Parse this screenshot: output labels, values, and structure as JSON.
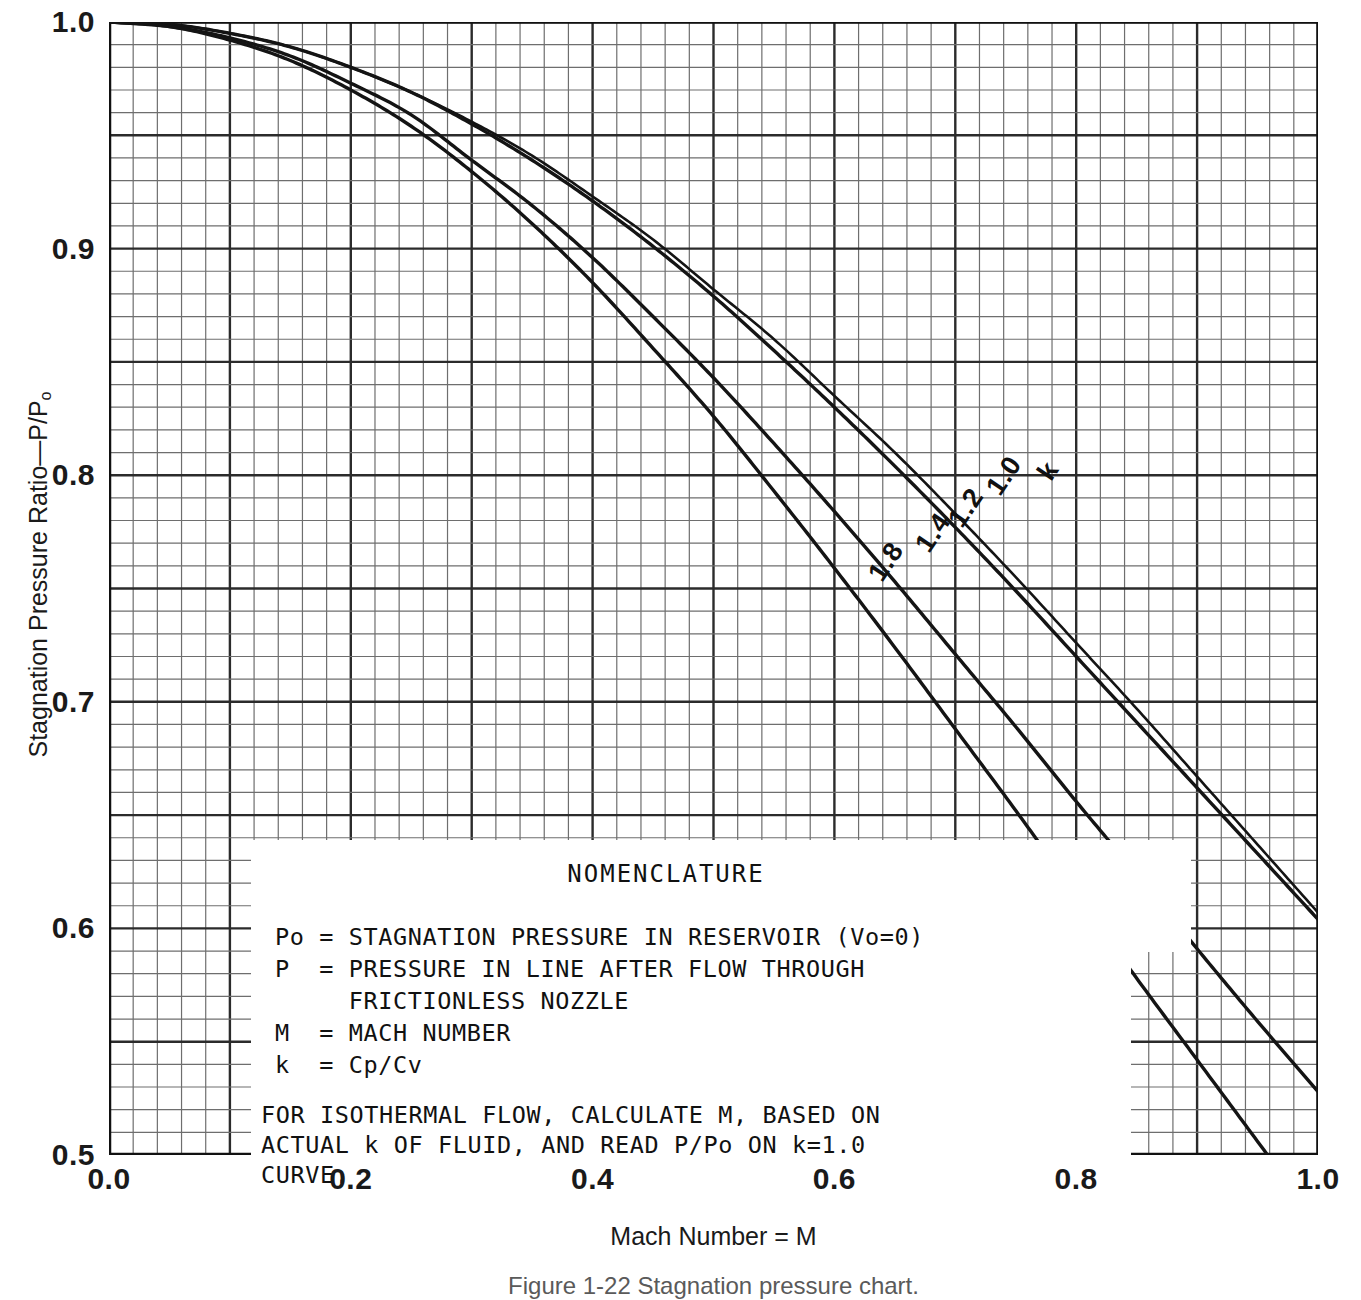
{
  "axes": {
    "x_title": "Mach Number = M",
    "y_title_main": "Stagnation Pressure Ratio—P/P",
    "y_title_sub": "o",
    "x_ticks": [
      "0.0",
      "0.2",
      "0.4",
      "0.6",
      "0.8",
      "1.0"
    ],
    "y_ticks": [
      "1.0",
      "0.9",
      "0.8",
      "0.7",
      "0.6",
      "0.5"
    ]
  },
  "caption": "Figure 1-22  Stagnation pressure chart.",
  "nomenclature": {
    "title": "NOMENCLATURE",
    "rows": [
      {
        "sym": "Po",
        "eq": "=",
        "text": "STAGNATION PRESSURE IN RESERVOIR (Vo=0)"
      },
      {
        "sym": "P",
        "eq": "=",
        "text": "PRESSURE IN LINE AFTER FLOW THROUGH"
      },
      {
        "sym": "",
        "eq": "",
        "text": "FRICTIONLESS NOZZLE"
      },
      {
        "sym": "M",
        "eq": "=",
        "text": "MACH NUMBER"
      },
      {
        "sym": "k",
        "eq": "=",
        "text": "Cp/Cv"
      }
    ],
    "note_line1": "FOR ISOTHERMAL FLOW, CALCULATE M, BASED ON",
    "note_line2": "ACTUAL k OF FLUID, AND READ P/Po ON k=1.0",
    "note_line3": "CURVE."
  },
  "curve_labels": [
    {
      "text": "k",
      "x": 935,
      "y": 440,
      "rot": -56
    },
    {
      "text": "1.0",
      "x": 884,
      "y": 455,
      "rot": -56
    },
    {
      "text": "1.2",
      "x": 846,
      "y": 487,
      "rot": -56
    },
    {
      "text": "1.4",
      "x": 813,
      "y": 512,
      "rot": -56
    },
    {
      "text": "1.8",
      "x": 766,
      "y": 541,
      "rot": -56
    }
  ],
  "chart_data": {
    "type": "line",
    "title": "Stagnation pressure chart",
    "xlabel": "Mach Number = M",
    "ylabel": "Stagnation Pressure Ratio—P/Po",
    "xlim": [
      0.0,
      1.0
    ],
    "ylim": [
      0.5,
      1.0
    ],
    "grid": true,
    "grid_major_x": 0.1,
    "grid_minor_x": 0.02,
    "grid_major_y": 0.05,
    "grid_minor_y": 0.01,
    "legend": "inline curve labels (k = 1.0, 1.2, 1.4, 1.8)",
    "x": [
      0.0,
      0.05,
      0.1,
      0.15,
      0.2,
      0.25,
      0.3,
      0.35,
      0.4,
      0.45,
      0.5,
      0.55,
      0.6,
      0.65,
      0.7,
      0.75,
      0.8,
      0.85,
      0.9,
      0.95,
      1.0
    ],
    "series": [
      {
        "name": "k = 1.0",
        "values": [
          1.0,
          0.999,
          0.995,
          0.989,
          0.98,
          0.969,
          0.956,
          0.941,
          0.923,
          0.904,
          0.882,
          0.86,
          0.835,
          0.81,
          0.783,
          0.755,
          0.726,
          0.697,
          0.667,
          0.637,
          0.607
        ]
      },
      {
        "name": "k = 1.2",
        "values": [
          1.0,
          0.999,
          0.995,
          0.989,
          0.98,
          0.969,
          0.955,
          0.939,
          0.921,
          0.901,
          0.879,
          0.855,
          0.83,
          0.804,
          0.777,
          0.749,
          0.72,
          0.691,
          0.662,
          0.633,
          0.604
        ]
      },
      {
        "name": "k = 1.4",
        "values": [
          1.0,
          0.998,
          0.993,
          0.985,
          0.973,
          0.959,
          0.939,
          0.919,
          0.896,
          0.87,
          0.843,
          0.814,
          0.784,
          0.753,
          0.721,
          0.689,
          0.656,
          0.624,
          0.591,
          0.559,
          0.528
        ]
      },
      {
        "name": "k = 1.8",
        "values": [
          1.0,
          0.998,
          0.992,
          0.983,
          0.97,
          0.954,
          0.934,
          0.911,
          0.885,
          0.856,
          0.826,
          0.793,
          0.759,
          0.724,
          0.688,
          0.652,
          0.615,
          0.578,
          0.542,
          0.506,
          0.47
        ]
      }
    ],
    "endpoints_at_M_1": {
      "k_1.0": 0.607,
      "k_1.2": 0.604,
      "k_1.4": 0.528
    },
    "k_1.8_exits_bottom_at_M": 0.96
  },
  "colors": {
    "ink": "#1a1a1a",
    "grid_major": "#2b2b2b",
    "grid_minor": "#6e6e6e",
    "background": "#ffffff"
  }
}
